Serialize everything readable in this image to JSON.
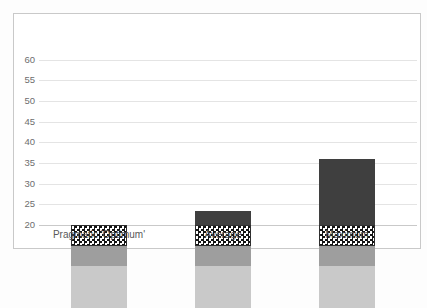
{
  "chart_data": {
    "type": "bar",
    "stacked": true,
    "title": "",
    "xlabel": "",
    "ylabel": "",
    "categories": [
      "Pragmatic 'Optimum'",
      "Average",
      "Maximum"
    ],
    "series": [
      {
        "name": "bottom-segment-light-gray",
        "style": "solid",
        "color": "#c9c9c9",
        "values": [
          10,
          10,
          10
        ]
      },
      {
        "name": "second-segment-medium-gray",
        "style": "solid",
        "color": "#9e9e9e",
        "values": [
          5,
          5,
          5
        ]
      },
      {
        "name": "third-segment-checkerboard",
        "style": "checkerboard",
        "pattern_colors": [
          "#151515",
          "#ffffff"
        ],
        "values": [
          5,
          5,
          5
        ]
      },
      {
        "name": "top-segment-dark-gray",
        "style": "solid",
        "color": "#3f3f3f",
        "values": [
          0,
          3.5,
          16
        ]
      }
    ],
    "bar_totals": [
      40,
      43.5,
      56
    ],
    "bars_start_at": 20,
    "ylim": [
      20,
      60
    ],
    "yticks": [
      20,
      25,
      30,
      35,
      40,
      45,
      50,
      55,
      60
    ],
    "ytick_step": 5,
    "grid": true,
    "legend_position": "none"
  },
  "colors": {
    "frame_border": "#c9c9c9",
    "gridline": "#e4e4e4",
    "axis_line": "#c9c9c9",
    "tick_label_text": "#6e6e6e",
    "category_label_text": "#595959",
    "plot_background": "#ffffff",
    "page_background": "#fdfdfd"
  }
}
